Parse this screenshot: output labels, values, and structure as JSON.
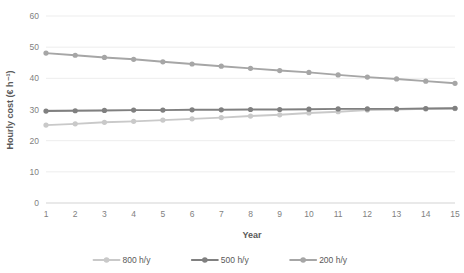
{
  "chart_data": {
    "type": "line",
    "title": "",
    "xlabel": "Year",
    "ylabel": "Hourly cost (€ h⁻¹)",
    "categories": [
      1,
      2,
      3,
      4,
      5,
      6,
      7,
      8,
      9,
      10,
      11,
      12,
      13,
      14,
      15
    ],
    "xlim": [
      1,
      15
    ],
    "ylim": [
      0,
      60
    ],
    "yticks": [
      0,
      10,
      20,
      30,
      40,
      50,
      60
    ],
    "xticks": [
      "1",
      "2",
      "3",
      "4",
      "5",
      "6",
      "7",
      "8",
      "9",
      "10",
      "11",
      "12",
      "13",
      "14",
      "15"
    ],
    "grid": "horizontal",
    "legend_position": "bottom",
    "series": [
      {
        "name": "800 h/y",
        "color": "#c9c9c9",
        "values": [
          25.0,
          25.4,
          25.9,
          26.2,
          26.6,
          27.0,
          27.4,
          27.9,
          28.3,
          28.9,
          29.3,
          29.8,
          30.0,
          30.2,
          30.3
        ]
      },
      {
        "name": "500 h/y",
        "color": "#808080",
        "values": [
          29.5,
          29.6,
          29.7,
          29.8,
          29.8,
          29.9,
          29.9,
          30.0,
          30.0,
          30.1,
          30.2,
          30.2,
          30.2,
          30.3,
          30.4
        ]
      },
      {
        "name": "200 h/y",
        "color": "#a6a6a6",
        "values": [
          48.1,
          47.4,
          46.7,
          46.1,
          45.3,
          44.6,
          43.9,
          43.2,
          42.5,
          41.9,
          41.1,
          40.4,
          39.8,
          39.1,
          38.4
        ]
      }
    ]
  },
  "legend": {
    "items": [
      {
        "label": "800 h/y",
        "color": "#c9c9c9"
      },
      {
        "label": "500 h/y",
        "color": "#808080"
      },
      {
        "label": "200 h/y",
        "color": "#a6a6a6"
      }
    ]
  },
  "axes": {
    "x_title": "Year",
    "y_title": "Hourly cost (€ h⁻¹)"
  }
}
